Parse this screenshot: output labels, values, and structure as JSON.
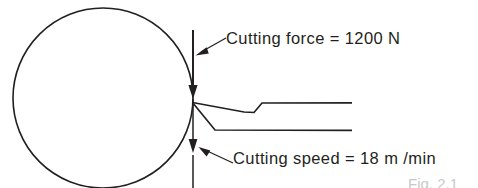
{
  "figure": {
    "type": "orthogonal-cutting-diagram",
    "background_color": "#ffffff",
    "stroke_color": "#231f20",
    "caption": "Fig. 2.1",
    "annotations": [
      {
        "id": "cutting-force",
        "label": "Cutting force = 1200 N",
        "quantity": "Cutting force",
        "value": "1200",
        "unit": "N",
        "direction": "downward"
      },
      {
        "id": "cutting-speed",
        "label": "Cutting speed = 18 m /min",
        "quantity": "Cutting speed",
        "value": "18",
        "unit": "m /min",
        "direction": "downward"
      }
    ],
    "parts": {
      "workpiece": "workpiece-circle",
      "force_vector": "cutting-force-arrow",
      "speed_vector": "cutting-speed-arrow",
      "tool": "cutting-tool-outline"
    }
  }
}
